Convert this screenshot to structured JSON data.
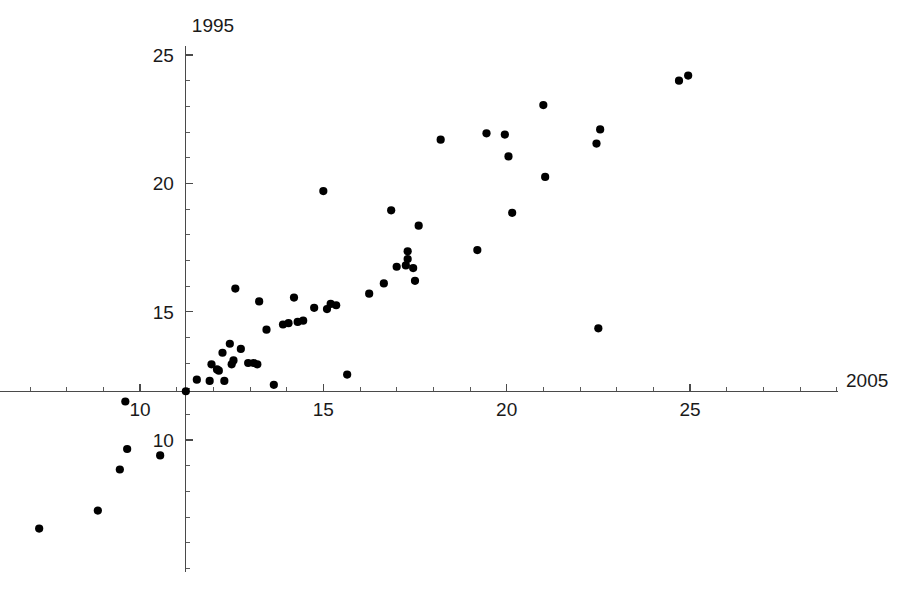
{
  "chart_data": {
    "type": "scatter",
    "title": "",
    "xlabel": "2005",
    "ylabel": "1995",
    "xlim": [
      7.0,
      25.6
    ],
    "ylim": [
      5.9,
      25.2
    ],
    "grid": false,
    "legend": null,
    "axis_origin": [
      11.25,
      11.9
    ],
    "x_ticks_major": [
      10,
      15,
      20,
      25
    ],
    "y_ticks_major": [
      10,
      15,
      20,
      25
    ],
    "x_tick_labels": [
      "10",
      "15",
      "20",
      "25"
    ],
    "y_tick_labels": [
      "10",
      "15",
      "20",
      "25"
    ],
    "minor_ticks_per_interval": 4,
    "point_color": "#000000",
    "axis_color": "#4a4a4a",
    "background_color": "#ffffff",
    "n_points": 66,
    "points": [
      [
        7.25,
        6.55
      ],
      [
        8.85,
        7.25
      ],
      [
        9.45,
        8.85
      ],
      [
        9.65,
        9.65
      ],
      [
        9.6,
        11.5
      ],
      [
        10.55,
        9.4
      ],
      [
        11.25,
        11.9
      ],
      [
        11.55,
        12.35
      ],
      [
        11.9,
        12.3
      ],
      [
        11.95,
        12.95
      ],
      [
        12.1,
        12.75
      ],
      [
        12.15,
        12.7
      ],
      [
        12.25,
        13.4
      ],
      [
        12.3,
        12.3
      ],
      [
        12.45,
        13.75
      ],
      [
        12.5,
        12.95
      ],
      [
        12.55,
        13.1
      ],
      [
        12.6,
        15.9
      ],
      [
        12.75,
        13.55
      ],
      [
        12.95,
        13.0
      ],
      [
        13.1,
        13.0
      ],
      [
        13.2,
        12.95
      ],
      [
        13.25,
        15.4
      ],
      [
        13.45,
        14.3
      ],
      [
        13.65,
        12.15
      ],
      [
        13.9,
        14.5
      ],
      [
        14.05,
        14.55
      ],
      [
        14.2,
        15.55
      ],
      [
        14.3,
        14.6
      ],
      [
        14.45,
        14.65
      ],
      [
        14.75,
        15.15
      ],
      [
        15.0,
        19.7
      ],
      [
        15.1,
        15.1
      ],
      [
        15.2,
        15.3
      ],
      [
        15.35,
        15.25
      ],
      [
        15.65,
        12.55
      ],
      [
        16.25,
        15.7
      ],
      [
        16.65,
        16.1
      ],
      [
        16.85,
        18.95
      ],
      [
        17.0,
        16.75
      ],
      [
        17.25,
        16.8
      ],
      [
        17.3,
        17.35
      ],
      [
        17.3,
        17.05
      ],
      [
        17.45,
        16.7
      ],
      [
        17.5,
        16.2
      ],
      [
        17.6,
        18.35
      ],
      [
        18.2,
        21.7
      ],
      [
        19.2,
        17.4
      ],
      [
        19.45,
        21.95
      ],
      [
        19.95,
        21.9
      ],
      [
        20.05,
        21.05
      ],
      [
        20.15,
        18.85
      ],
      [
        21.0,
        23.05
      ],
      [
        21.05,
        20.25
      ],
      [
        22.45,
        21.55
      ],
      [
        22.5,
        14.35
      ],
      [
        22.55,
        22.1
      ],
      [
        24.7,
        24.0
      ],
      [
        24.95,
        24.2
      ]
    ]
  },
  "axes": {
    "x_axis_label": "2005",
    "y_axis_label": "1995",
    "x_tick_labels": [
      "10",
      "15",
      "20",
      "25"
    ],
    "y_tick_labels": [
      "10",
      "15",
      "20",
      "25"
    ]
  }
}
